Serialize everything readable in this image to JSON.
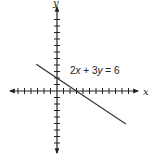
{
  "chart_data": {
    "type": "line",
    "title": "",
    "xlabel": "x",
    "ylabel": "y",
    "grid": false,
    "xlim": [
      -9,
      13
    ],
    "ylim": [
      -9,
      13
    ],
    "origin_px": [
      57,
      91
    ],
    "tick_spacing_px": 6.5,
    "series": [
      {
        "name": "2x + 3y = 6",
        "equation": "2x + 3y = 6",
        "x_intercept": 3,
        "y_intercept": 2,
        "slope": -0.6667,
        "x": [
          -3.2,
          10.6
        ],
        "y": [
          4.13,
          -5.07
        ]
      }
    ],
    "annotations": [
      {
        "text": "2x + 3y = 6",
        "x": 2.4,
        "y": 3.8
      }
    ]
  },
  "labels": {
    "x_axis": "x",
    "y_axis": "y",
    "equation_prefix": "2",
    "equation_var1": "x",
    "equation_mid": " + 3",
    "equation_var2": "y",
    "equation_suffix": " = 6"
  },
  "colors": {
    "axis": "#222222",
    "line": "#333333",
    "background": "#ffffff"
  }
}
